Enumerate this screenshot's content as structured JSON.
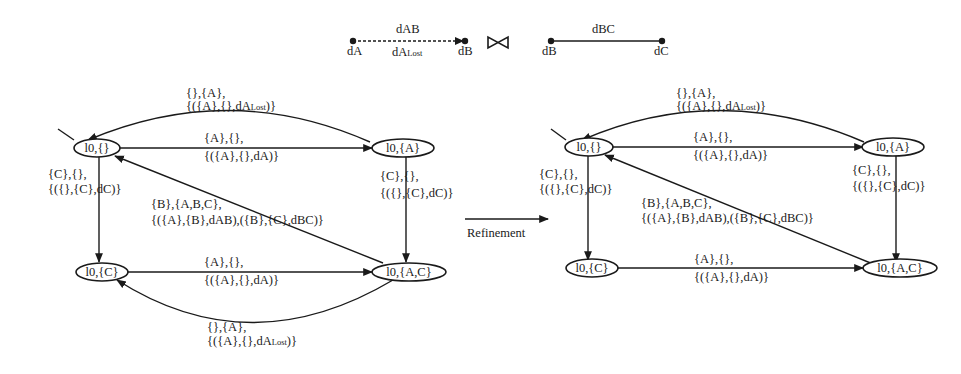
{
  "legend": {
    "channel_ab": {
      "label_top": "dAB",
      "label_bottom_main": "dA",
      "label_bottom_sub": "Lost",
      "from": "dA",
      "to": "dB",
      "style": "dashed"
    },
    "join_symbol": "⋈",
    "channel_bc": {
      "label_top": "dBC",
      "from": "dB",
      "to": "dC",
      "style": "solid"
    }
  },
  "refinement_arrow": {
    "label": "Refinement"
  },
  "left_automaton": {
    "nodes": {
      "n0": "l0,{}",
      "nA": "l0,{A}",
      "nC": "l0,{C}",
      "nAC": "l0,{A,C}"
    },
    "edges": {
      "top_arc": {
        "line1": "{},{A},",
        "line2_main": "{({A},{},dA",
        "line2_sub": "Lost",
        "line2_end": ")}"
      },
      "top_straight": {
        "line1": "{A},{},",
        "line2": "{({A},{},dA)}"
      },
      "left_vertical": {
        "line1": "{C},{},",
        "line2": "{({},{C},dC)}"
      },
      "right_vertical": {
        "line1": "{C},{},",
        "line2": "{({},{C},dC)}"
      },
      "diagonal": {
        "line1": "{B},{A,B,C},",
        "line2": "{({A},{B},dAB),({B},{C},dBC)}"
      },
      "bottom_straight": {
        "line1": "{A},{},",
        "line2": "{({A},{},dA)}"
      },
      "bottom_arc": {
        "line1": "{},{A},",
        "line2_main": "{({A},{},dA",
        "line2_sub": "Lost",
        "line2_end": ")}"
      }
    }
  },
  "right_automaton": {
    "nodes": {
      "n0": "l0,{}",
      "nA": "l0,{A}",
      "nC": "l0,{C}",
      "nAC": "l0,{A,C}"
    },
    "edges": {
      "top_arc": {
        "line1": "{},{A},",
        "line2_main": "{({A},{},dA",
        "line2_sub": "Lost",
        "line2_end": ")}"
      },
      "top_straight": {
        "line1": "{A},{},",
        "line2": "{({A},{},dA)}"
      },
      "left_vertical": {
        "line1": "{C},{},",
        "line2": "{({},{C},dC)}"
      },
      "right_vertical": {
        "line1": "{C},{},",
        "line2": "{({},{C},dC)}"
      },
      "diagonal": {
        "line1": "{B},{A,B,C},",
        "line2": "{({A},{B},dAB),({B},{C},dBC)}"
      },
      "bottom_straight": {
        "line1": "{A},{},",
        "line2": "{({A},{},dA)}"
      }
    }
  },
  "colors": {
    "ink": "#1a1a1a",
    "background": "#ffffff"
  }
}
